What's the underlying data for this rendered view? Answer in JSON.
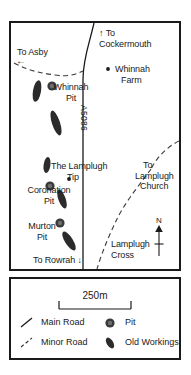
{
  "map": {
    "road_id": "A5086",
    "places": [
      {
        "id": "to-asby",
        "label": "To Asby",
        "x": 6,
        "y": 26
      },
      {
        "id": "to-cockermouth",
        "label": "To\nCockermouth",
        "x": 88,
        "y": 6
      },
      {
        "id": "whinnah-farm",
        "label": "Whinnah\nFarm",
        "x": 101,
        "y": 43
      },
      {
        "id": "whinnah-pit",
        "label": "Whinnah\nPit",
        "x": 31,
        "y": 60
      },
      {
        "id": "lamplugh-tip",
        "label": "The Lamplugh\nTip",
        "x": 40,
        "y": 142
      },
      {
        "id": "coronation-pit",
        "label": "Coronation\nPit",
        "x": 3,
        "y": 166
      },
      {
        "id": "murton-pit",
        "label": "Murton\nPit",
        "x": 8,
        "y": 202
      },
      {
        "id": "lamplugh-church",
        "label": "To\nLamplugh\nChurch",
        "x": 125,
        "y": 139
      },
      {
        "id": "lamplugh-cross",
        "label": "Lamplugh\nCross",
        "x": 103,
        "y": 219
      },
      {
        "id": "to-rowrah",
        "label": "To Rowrah",
        "x": 24,
        "y": 235
      }
    ],
    "arrows": {
      "cockermouth": "↑",
      "asby": "←",
      "rowrah": "↓"
    },
    "north_letter": "N"
  },
  "legend": {
    "scale_label": "250m",
    "entries": [
      {
        "id": "main-road",
        "label": "Main Road"
      },
      {
        "id": "minor-road",
        "label": "Minor Road"
      },
      {
        "id": "pit",
        "label": "Pit"
      },
      {
        "id": "old-workings",
        "label": "Old Workings"
      }
    ]
  },
  "colors": {
    "ink": "#1a1a1a",
    "feature": "#2b2b2b",
    "pit_fill": "#4a4a4a",
    "paper": "#ffffff"
  }
}
